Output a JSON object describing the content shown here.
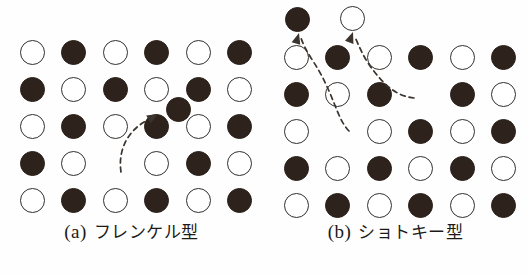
{
  "figure": {
    "background_color": "#fefefe",
    "atom_filled_color": "#2e231c",
    "atom_open_border_color": "#32302e",
    "arrow_color": "#3a332e"
  },
  "panels": [
    {
      "id": "panel-a",
      "caption_index": "(a)",
      "caption_label": "フレンケル型",
      "defect_type": "Frenkel",
      "grid": {
        "columns": 6,
        "rows": 5,
        "x_start": 32,
        "x_step": 41.5,
        "y_start": 52,
        "y_step": 37,
        "radius": 12.5
      },
      "sites": [
        [
          "open",
          "filled",
          "open",
          "filled",
          "open",
          "filled"
        ],
        [
          "filled",
          "open",
          "filled",
          "open",
          "filled",
          "open"
        ],
        [
          "open",
          "filled",
          "open",
          "filled",
          "open",
          "filled"
        ],
        [
          "filled",
          "open",
          "vacancy",
          "open",
          "filled",
          "open"
        ],
        [
          "open",
          "filled",
          "open",
          "filled",
          "open",
          "filled"
        ]
      ],
      "interstitial": {
        "label": "interstitial-atom",
        "type": "filled",
        "x": 178,
        "y": 109,
        "radius": 12.5
      },
      "arrow": {
        "label": "frenkel-migration-arrow",
        "path": "M 121 172 C 118 152, 126 132, 146 121",
        "head_x": 158,
        "head_y": 114,
        "head_angle": -30
      }
    },
    {
      "id": "panel-b",
      "caption_index": "(b)",
      "caption_label": "ショトキー型",
      "defect_type": "Schottky",
      "grid": {
        "columns": 6,
        "rows": 5,
        "x_start": 32,
        "x_step": 41.5,
        "y_start": 57,
        "y_step": 37,
        "radius": 12.5
      },
      "sites": [
        [
          "open",
          "filled",
          "open",
          "filled",
          "open",
          "filled"
        ],
        [
          "filled",
          "open",
          "filled",
          "vacancy",
          "filled",
          "open"
        ],
        [
          "open",
          "vacancy",
          "open",
          "filled",
          "open",
          "filled"
        ],
        [
          "filled",
          "open",
          "filled",
          "open",
          "filled",
          "open"
        ],
        [
          "open",
          "filled",
          "open",
          "filled",
          "open",
          "filled"
        ]
      ],
      "surface_atoms": [
        {
          "label": "surface-atom-filled",
          "type": "filled",
          "x": 33,
          "y": 19,
          "radius": 12.5
        },
        {
          "label": "surface-atom-open",
          "type": "open",
          "x": 88,
          "y": 18,
          "radius": 12.5
        }
      ],
      "arrows": [
        {
          "label": "schottky-migration-arrow-left",
          "path": "M 85 131 C 72 118, 70 92, 47 58 C 42 50, 39 44, 37 38",
          "head_x": 35,
          "head_y": 33,
          "head_angle": -74
        },
        {
          "label": "schottky-migration-arrow-right",
          "path": "M 150 98 C 132 96, 120 85, 106 66 C 99 56, 94 44, 91 37",
          "head_x": 89,
          "head_y": 32,
          "head_angle": -70
        }
      ]
    }
  ]
}
